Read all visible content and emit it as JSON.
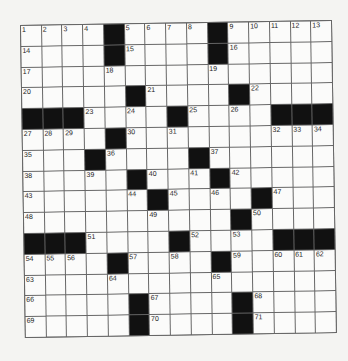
{
  "puzzle": {
    "rows": 15,
    "cols": 15,
    "colors": {
      "black_square": "#111111",
      "white_square": "#fbfbfa",
      "grid_line": "#666666",
      "background": "#f4f4f2"
    },
    "black_cells": [
      [
        0,
        4
      ],
      [
        0,
        9
      ],
      [
        1,
        4
      ],
      [
        1,
        9
      ],
      [
        3,
        5
      ],
      [
        3,
        10
      ],
      [
        4,
        0
      ],
      [
        4,
        1
      ],
      [
        4,
        2
      ],
      [
        4,
        7
      ],
      [
        4,
        12
      ],
      [
        4,
        13
      ],
      [
        4,
        14
      ],
      [
        5,
        4
      ],
      [
        6,
        3
      ],
      [
        6,
        8
      ],
      [
        7,
        5
      ],
      [
        7,
        9
      ],
      [
        8,
        6
      ],
      [
        8,
        11
      ],
      [
        9,
        10
      ],
      [
        10,
        0
      ],
      [
        10,
        1
      ],
      [
        10,
        2
      ],
      [
        10,
        7
      ],
      [
        10,
        12
      ],
      [
        10,
        13
      ],
      [
        10,
        14
      ],
      [
        11,
        4
      ],
      [
        11,
        9
      ],
      [
        13,
        5
      ],
      [
        13,
        10
      ],
      [
        14,
        5
      ],
      [
        14,
        10
      ]
    ],
    "numbers": [
      {
        "r": 0,
        "c": 0,
        "n": "1"
      },
      {
        "r": 0,
        "c": 1,
        "n": "2"
      },
      {
        "r": 0,
        "c": 2,
        "n": "3"
      },
      {
        "r": 0,
        "c": 3,
        "n": "4"
      },
      {
        "r": 0,
        "c": 5,
        "n": "5"
      },
      {
        "r": 0,
        "c": 6,
        "n": "6"
      },
      {
        "r": 0,
        "c": 7,
        "n": "7"
      },
      {
        "r": 0,
        "c": 8,
        "n": "8"
      },
      {
        "r": 0,
        "c": 10,
        "n": "9"
      },
      {
        "r": 0,
        "c": 11,
        "n": "10"
      },
      {
        "r": 0,
        "c": 12,
        "n": "11"
      },
      {
        "r": 0,
        "c": 13,
        "n": "12"
      },
      {
        "r": 0,
        "c": 14,
        "n": "13"
      },
      {
        "r": 1,
        "c": 0,
        "n": "14"
      },
      {
        "r": 1,
        "c": 5,
        "n": "15"
      },
      {
        "r": 1,
        "c": 10,
        "n": "16"
      },
      {
        "r": 2,
        "c": 0,
        "n": "17"
      },
      {
        "r": 2,
        "c": 4,
        "n": "18"
      },
      {
        "r": 2,
        "c": 9,
        "n": "19"
      },
      {
        "r": 3,
        "c": 0,
        "n": "20"
      },
      {
        "r": 3,
        "c": 6,
        "n": "21"
      },
      {
        "r": 3,
        "c": 11,
        "n": "22"
      },
      {
        "r": 4,
        "c": 3,
        "n": "23"
      },
      {
        "r": 4,
        "c": 5,
        "n": "24"
      },
      {
        "r": 4,
        "c": 8,
        "n": "25"
      },
      {
        "r": 4,
        "c": 10,
        "n": "26"
      },
      {
        "r": 5,
        "c": 0,
        "n": "27"
      },
      {
        "r": 5,
        "c": 1,
        "n": "28"
      },
      {
        "r": 5,
        "c": 2,
        "n": "29"
      },
      {
        "r": 5,
        "c": 5,
        "n": "30"
      },
      {
        "r": 5,
        "c": 7,
        "n": "31"
      },
      {
        "r": 5,
        "c": 12,
        "n": "32"
      },
      {
        "r": 5,
        "c": 13,
        "n": "33"
      },
      {
        "r": 5,
        "c": 14,
        "n": "34"
      },
      {
        "r": 6,
        "c": 0,
        "n": "35"
      },
      {
        "r": 6,
        "c": 4,
        "n": "36"
      },
      {
        "r": 6,
        "c": 9,
        "n": "37"
      },
      {
        "r": 7,
        "c": 0,
        "n": "38"
      },
      {
        "r": 7,
        "c": 3,
        "n": "39"
      },
      {
        "r": 7,
        "c": 6,
        "n": "40"
      },
      {
        "r": 7,
        "c": 8,
        "n": "41"
      },
      {
        "r": 7,
        "c": 10,
        "n": "42"
      },
      {
        "r": 8,
        "c": 0,
        "n": "43"
      },
      {
        "r": 8,
        "c": 5,
        "n": "44"
      },
      {
        "r": 8,
        "c": 7,
        "n": "45"
      },
      {
        "r": 8,
        "c": 9,
        "n": "46"
      },
      {
        "r": 8,
        "c": 12,
        "n": "47"
      },
      {
        "r": 9,
        "c": 0,
        "n": "48"
      },
      {
        "r": 9,
        "c": 6,
        "n": "49"
      },
      {
        "r": 9,
        "c": 11,
        "n": "50"
      },
      {
        "r": 10,
        "c": 3,
        "n": "51"
      },
      {
        "r": 10,
        "c": 8,
        "n": "52"
      },
      {
        "r": 10,
        "c": 10,
        "n": "53"
      },
      {
        "r": 11,
        "c": 0,
        "n": "54"
      },
      {
        "r": 11,
        "c": 1,
        "n": "55"
      },
      {
        "r": 11,
        "c": 2,
        "n": "56"
      },
      {
        "r": 11,
        "c": 5,
        "n": "57"
      },
      {
        "r": 11,
        "c": 7,
        "n": "58"
      },
      {
        "r": 11,
        "c": 10,
        "n": "59"
      },
      {
        "r": 11,
        "c": 12,
        "n": "60"
      },
      {
        "r": 11,
        "c": 13,
        "n": "61"
      },
      {
        "r": 11,
        "c": 14,
        "n": "62"
      },
      {
        "r": 12,
        "c": 0,
        "n": "63"
      },
      {
        "r": 12,
        "c": 4,
        "n": "64"
      },
      {
        "r": 12,
        "c": 9,
        "n": "65"
      },
      {
        "r": 13,
        "c": 0,
        "n": "66"
      },
      {
        "r": 13,
        "c": 6,
        "n": "67"
      },
      {
        "r": 13,
        "c": 11,
        "n": "68"
      },
      {
        "r": 14,
        "c": 0,
        "n": "69"
      },
      {
        "r": 14,
        "c": 6,
        "n": "70"
      },
      {
        "r": 14,
        "c": 11,
        "n": "71"
      }
    ]
  }
}
